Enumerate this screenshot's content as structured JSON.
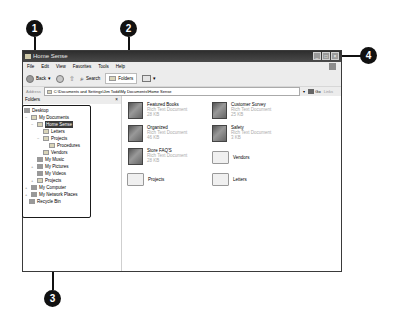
{
  "window": {
    "title": "Home Sense",
    "buttons": {
      "minimize": "_",
      "maximize": "□",
      "close": "×"
    }
  },
  "menu": [
    "File",
    "Edit",
    "View",
    "Favorites",
    "Tools",
    "Help"
  ],
  "toolbar": {
    "back_label": "Back",
    "search_label": "Search",
    "folders_label": "Folders"
  },
  "address": {
    "label": "Address",
    "value": "C:\\Documents and Settings\\Jim Todd\\My Documents\\Home Sense",
    "go_label": "Go",
    "links_label": "Links"
  },
  "folders_panel": {
    "title": "Folders",
    "close": "×",
    "tree": [
      {
        "label": "Desktop",
        "level": 0,
        "toggle": ""
      },
      {
        "label": "My Documents",
        "level": 1,
        "toggle": "−"
      },
      {
        "label": "Home Sense",
        "level": 2,
        "toggle": "−",
        "selected": true
      },
      {
        "label": "Letters",
        "level": 3,
        "toggle": ""
      },
      {
        "label": "Projects",
        "level": 3,
        "toggle": "−"
      },
      {
        "label": "Procedures",
        "level": 4,
        "toggle": ""
      },
      {
        "label": "Vendors",
        "level": 3,
        "toggle": ""
      },
      {
        "label": "My Music",
        "level": 2,
        "toggle": ""
      },
      {
        "label": "My Pictures",
        "level": 2,
        "toggle": "+"
      },
      {
        "label": "My Videos",
        "level": 2,
        "toggle": ""
      },
      {
        "label": "Projects",
        "level": 2,
        "toggle": "+"
      },
      {
        "label": "My Computer",
        "level": 1,
        "toggle": "+"
      },
      {
        "label": "My Network Places",
        "level": 1,
        "toggle": "+"
      },
      {
        "label": "Recycle Bin",
        "level": 1,
        "toggle": ""
      }
    ]
  },
  "files": [
    {
      "name": "Featured Books",
      "type": "Rich Text Document",
      "size": "28 KB",
      "icon": "document"
    },
    {
      "name": "Customer Survey",
      "type": "Rich Text Document",
      "size": "25 KB",
      "icon": "document"
    },
    {
      "name": "Organized",
      "type": "Rich Text Document",
      "size": "46 KB",
      "icon": "document"
    },
    {
      "name": "Safety",
      "type": "Rich Text Document",
      "size": "3 KB",
      "icon": "document"
    },
    {
      "name": "Store FAQ'S",
      "type": "Rich Text Document",
      "size": "28 KB",
      "icon": "document"
    },
    {
      "name": "Vendors",
      "type": "",
      "size": "",
      "icon": "folder"
    },
    {
      "name": "Projects",
      "type": "",
      "size": "",
      "icon": "folder"
    },
    {
      "name": "Letters",
      "type": "",
      "size": "",
      "icon": "folder"
    }
  ],
  "callouts": [
    "1",
    "2",
    "3",
    "4"
  ]
}
